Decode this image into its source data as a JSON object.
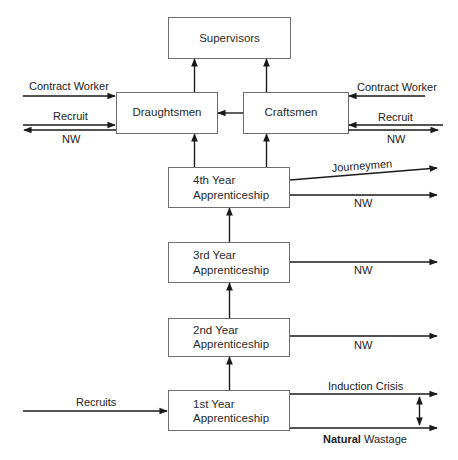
{
  "diagram": {
    "type": "flow",
    "boxes": {
      "supervisors": "Supervisors",
      "draughtsmen": "Draughtsmen",
      "craftsmen": "Craftsmen",
      "year4": {
        "line1": "4th Year",
        "line2": "Apprenticeship"
      },
      "year3": {
        "line1": "3rd Year",
        "line2": "Apprenticeship"
      },
      "year2": {
        "line1": "2nd Year",
        "line2": "Apprenticeship"
      },
      "year1": {
        "line1": "1st Year",
        "line2": "Apprenticeship"
      }
    },
    "flows": {
      "left_contract_worker": "Contract Worker",
      "left_recruit": "Recruit",
      "left_nw": "NW",
      "right_contract_worker": "Contract Worker",
      "right_recruit": "Recruit",
      "right_nw": "NW",
      "journeymen": "Journeymen",
      "year4_nw": "NW",
      "year3_nw": "NW",
      "year2_nw": "NW",
      "induction_crisis": "Induction Crisis",
      "natural_wastage_prefix": "Natural",
      "natural_wastage_suffix": " Wastage",
      "recruits": "Recruits"
    }
  }
}
